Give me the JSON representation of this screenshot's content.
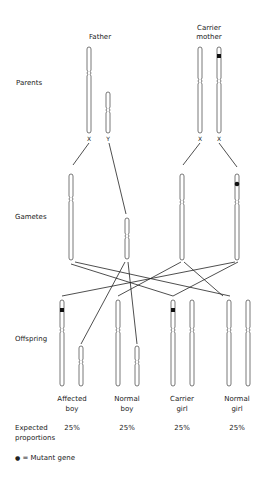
{
  "parents": {
    "row_label": "Parents",
    "father": {
      "title": "Father",
      "chromosomes": [
        "X",
        "Y"
      ]
    },
    "mother": {
      "title_line1": "Carrier",
      "title_line2": "mother",
      "chromosomes": [
        "X",
        "X"
      ]
    }
  },
  "gametes": {
    "row_label": "Gametes"
  },
  "offspring": {
    "row_label": "Offspring",
    "groups": [
      {
        "label_line1": "Affected",
        "label_line2": "boy",
        "proportion": "25%"
      },
      {
        "label_line1": "Normal",
        "label_line2": "boy",
        "proportion": "25%"
      },
      {
        "label_line1": "Carrier",
        "label_line2": "girl",
        "proportion": "25%"
      },
      {
        "label_line1": "Normal",
        "label_line2": "girl",
        "proportion": "25%"
      }
    ]
  },
  "expected": {
    "label_line1": "Expected",
    "label_line2": "proportions"
  },
  "legend": {
    "symbol": "●",
    "text": "= Mutant gene"
  },
  "colors": {
    "line": "#222222",
    "chromosome_stroke": "#555555",
    "mutant": "#111111"
  }
}
